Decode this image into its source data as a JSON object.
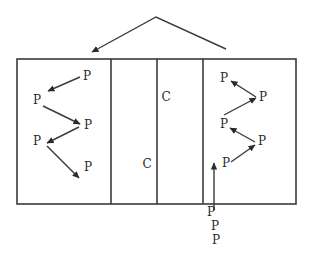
{
  "diagram": {
    "width": 311,
    "height": 262,
    "colors": {
      "line": "#3a3a3a",
      "text": "#2a2a2a",
      "background": "#ffffff"
    },
    "court": {
      "x": 17,
      "y": 59,
      "width": 279,
      "height": 145,
      "dividers_x": [
        111,
        157,
        203
      ]
    },
    "top_arrow": {
      "points": [
        [
          226,
          49
        ],
        [
          156,
          17
        ],
        [
          92,
          52
        ]
      ],
      "arrowhead_at": "left-end"
    },
    "labels": [
      {
        "id": "p-left-1",
        "text": "P",
        "x": 87,
        "y": 76
      },
      {
        "id": "p-left-2",
        "text": "P",
        "x": 37,
        "y": 100
      },
      {
        "id": "p-left-3",
        "text": "P",
        "x": 88,
        "y": 125
      },
      {
        "id": "p-left-4",
        "text": "P",
        "x": 37,
        "y": 141
      },
      {
        "id": "p-left-5",
        "text": "P",
        "x": 88,
        "y": 167
      },
      {
        "id": "c-upper",
        "text": "C",
        "x": 166,
        "y": 97
      },
      {
        "id": "c-lower",
        "text": "C",
        "x": 147,
        "y": 164
      },
      {
        "id": "p-right-1",
        "text": "P",
        "x": 224,
        "y": 78
      },
      {
        "id": "p-right-2",
        "text": "P",
        "x": 263,
        "y": 97
      },
      {
        "id": "p-right-3",
        "text": "P",
        "x": 224,
        "y": 124
      },
      {
        "id": "p-right-4",
        "text": "P",
        "x": 262,
        "y": 141
      },
      {
        "id": "p-right-5",
        "text": "P",
        "x": 226,
        "y": 163
      },
      {
        "id": "p-queue-1",
        "text": "P",
        "x": 211,
        "y": 212
      },
      {
        "id": "p-queue-2",
        "text": "P",
        "x": 215,
        "y": 226
      },
      {
        "id": "p-queue-3",
        "text": "P",
        "x": 216,
        "y": 240
      }
    ],
    "arrows": [
      {
        "id": "left-a1",
        "from": [
          80,
          77
        ],
        "to": [
          48,
          91
        ]
      },
      {
        "id": "left-a2",
        "from": [
          43,
          106
        ],
        "to": [
          80,
          124
        ]
      },
      {
        "id": "left-a3",
        "from": [
          79,
          127
        ],
        "to": [
          47,
          143
        ]
      },
      {
        "id": "left-a4",
        "from": [
          47,
          146
        ],
        "to": [
          79,
          178
        ]
      },
      {
        "id": "right-a1",
        "from": [
          256,
          97
        ],
        "to": [
          231,
          81
        ]
      },
      {
        "id": "right-a2",
        "from": [
          224,
          115
        ],
        "to": [
          256,
          98
        ]
      },
      {
        "id": "right-a3",
        "from": [
          255,
          142
        ],
        "to": [
          230,
          128
        ]
      },
      {
        "id": "right-a4",
        "from": [
          231,
          162
        ],
        "to": [
          255,
          145
        ]
      },
      {
        "id": "entry-a1",
        "from": [
          214,
          210
        ],
        "to": [
          214,
          163
        ]
      }
    ]
  }
}
